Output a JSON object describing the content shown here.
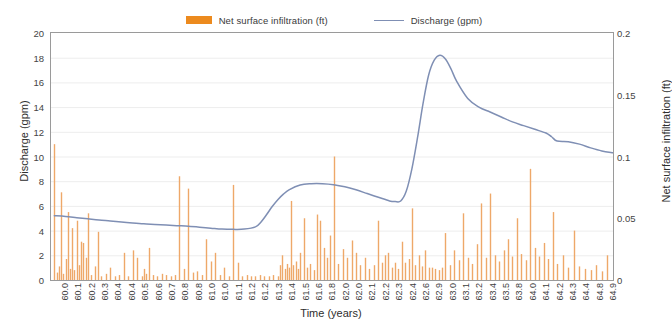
{
  "legend": {
    "position": "top-center",
    "items": [
      {
        "label": "Net surface infiltration (ft)",
        "marker": "bar-swatch-icon",
        "color": "#ec8a1e"
      },
      {
        "label": "Discharge (gpm)",
        "marker": "line-swatch-icon",
        "color": "#7f8fb4"
      }
    ]
  },
  "axes": {
    "x_title": "Time (years)",
    "y_left_title": "Discharge (gpm)",
    "y_right_title": "Net surface infiltration (ft)",
    "y_left_ticks": [
      "0",
      "2",
      "4",
      "6",
      "8",
      "10",
      "12",
      "14",
      "16",
      "18",
      "20"
    ],
    "y_right_ticks": [
      "0",
      "0.05",
      "0.1",
      "0.15",
      "0.2"
    ],
    "x_ticks": [
      "60.0",
      "60.1",
      "60.2",
      "60.3",
      "60.4",
      "60.4",
      "60.5",
      "60.6",
      "60.7",
      "60.8",
      "60.8",
      "61.0",
      "61.0",
      "61.1",
      "61.2",
      "61.2",
      "61.3",
      "61.4",
      "61.5",
      "61.6",
      "61.8",
      "62.0",
      "62.0",
      "62.1",
      "62.2",
      "62.3",
      "62.4",
      "62.6",
      "62.9",
      "63.0",
      "63.1",
      "63.2",
      "63.4",
      "63.5",
      "63.8",
      "64.0",
      "64.1",
      "64.2",
      "64.3",
      "64.4",
      "64.8",
      "64.9"
    ]
  },
  "chart_data": {
    "type": "bar",
    "title": "",
    "xlabel": "Time (years)",
    "ylabel": "Discharge (gpm)",
    "y2label": "Net surface infiltration (ft)",
    "xlim": [
      59.97,
      65.0
    ],
    "ylim": [
      0,
      20
    ],
    "y2lim": [
      0,
      0.2
    ],
    "grid": true,
    "legend_position": "top-center",
    "series": [
      {
        "name": "Net surface infiltration (ft)",
        "type": "bar",
        "axis": "right",
        "color": "#eea869",
        "x": [
          60.0,
          60.02,
          60.04,
          60.06,
          60.08,
          60.1,
          60.12,
          60.14,
          60.16,
          60.18,
          60.2,
          60.22,
          60.24,
          60.26,
          60.28,
          60.3,
          60.33,
          60.36,
          60.39,
          60.42,
          60.46,
          60.5,
          60.54,
          60.58,
          60.62,
          60.66,
          60.7,
          60.74,
          60.78,
          60.8,
          60.82,
          60.85,
          60.88,
          60.92,
          60.96,
          61.0,
          61.04,
          61.08,
          61.12,
          61.16,
          61.2,
          61.24,
          61.28,
          61.32,
          61.36,
          61.4,
          61.44,
          61.48,
          61.52,
          61.56,
          61.6,
          61.64,
          61.68,
          61.72,
          61.76,
          61.8,
          61.84,
          61.88,
          61.92,
          61.96,
          62.0,
          62.02,
          62.04,
          62.06,
          62.08,
          62.1,
          62.12,
          62.14,
          62.16,
          62.18,
          62.2,
          62.23,
          62.26,
          62.29,
          62.32,
          62.35,
          62.38,
          62.41,
          62.44,
          62.47,
          62.5,
          62.54,
          62.58,
          62.62,
          62.66,
          62.7,
          62.74,
          62.78,
          62.82,
          62.86,
          62.9,
          62.93,
          62.96,
          62.99,
          63.02,
          63.05,
          63.08,
          63.11,
          63.14,
          63.17,
          63.2,
          63.23,
          63.26,
          63.29,
          63.32,
          63.35,
          63.38,
          63.41,
          63.44,
          63.47,
          63.5,
          63.54,
          63.58,
          63.62,
          63.66,
          63.7,
          63.74,
          63.78,
          63.82,
          63.86,
          63.9,
          63.94,
          63.98,
          64.02,
          64.06,
          64.1,
          64.14,
          64.18,
          64.22,
          64.26,
          64.3,
          64.34,
          64.38,
          64.42,
          64.46,
          64.5,
          64.55,
          64.6,
          64.65,
          64.7,
          64.75,
          64.8,
          64.85,
          64.9,
          64.95
        ],
        "values_gpm_scale": [
          11.0,
          0.6,
          1.1,
          7.1,
          0.5,
          1.7,
          5.5,
          0.9,
          4.2,
          0.8,
          4.8,
          1.2,
          3.1,
          3.0,
          1.8,
          5.4,
          0.4,
          1.1,
          3.9,
          0.3,
          0.5,
          1.0,
          0.3,
          0.4,
          2.2,
          0.3,
          2.4,
          1.8,
          0.3,
          0.9,
          0.5,
          2.6,
          0.4,
          0.3,
          0.5,
          0.4,
          0.3,
          0.4,
          8.4,
          0.9,
          7.4,
          0.6,
          0.7,
          0.4,
          3.3,
          1.5,
          2.2,
          0.4,
          1.0,
          0.3,
          7.7,
          1.4,
          0.3,
          0.4,
          0.3,
          0.3,
          0.4,
          0.3,
          0.3,
          0.4,
          0.3,
          1.2,
          2.0,
          0.9,
          1.3,
          1.0,
          6.4,
          1.2,
          1.5,
          0.9,
          2.2,
          5.0,
          1.0,
          1.3,
          0.8,
          5.3,
          4.8,
          2.6,
          1.8,
          3.6,
          10.0,
          1.3,
          2.5,
          1.8,
          3.2,
          2.2,
          1.2,
          1.8,
          0.9,
          1.2,
          4.8,
          1.4,
          2.0,
          2.2,
          1.0,
          1.4,
          0.9,
          3.1,
          1.4,
          1.7,
          5.8,
          1.2,
          2.0,
          1.1,
          2.4,
          1.0,
          1.0,
          0.9,
          0.8,
          1.0,
          3.8,
          1.2,
          2.4,
          1.6,
          5.4,
          1.8,
          1.3,
          2.9,
          6.2,
          1.8,
          7.0,
          2.0,
          1.5,
          2.4,
          3.3,
          1.9,
          5.0,
          2.1,
          1.6,
          9.0,
          2.6,
          1.9,
          3.0,
          1.7,
          5.5,
          1.3,
          2.0,
          1.0,
          4.0,
          1.1,
          0.9,
          0.8,
          1.2,
          0.7,
          2.0
        ]
      },
      {
        "name": "Discharge (gpm)",
        "type": "line",
        "axis": "left",
        "color": "#7f8fb4",
        "x": [
          60.0,
          60.1,
          60.2,
          60.3,
          60.4,
          60.5,
          60.6,
          60.7,
          60.8,
          60.9,
          61.0,
          61.1,
          61.2,
          61.3,
          61.4,
          61.5,
          61.6,
          61.7,
          61.8,
          61.85,
          61.9,
          61.95,
          62.0,
          62.05,
          62.1,
          62.2,
          62.3,
          62.4,
          62.5,
          62.6,
          62.7,
          62.8,
          62.9,
          63.0,
          63.05,
          63.1,
          63.15,
          63.2,
          63.25,
          63.3,
          63.35,
          63.4,
          63.45,
          63.5,
          63.55,
          63.6,
          63.7,
          63.8,
          63.9,
          64.0,
          64.1,
          64.2,
          64.3,
          64.4,
          64.45,
          64.5,
          64.6,
          64.7,
          64.8,
          64.9,
          65.0
        ],
        "values": [
          5.2,
          5.15,
          5.05,
          4.95,
          4.85,
          4.78,
          4.7,
          4.62,
          4.55,
          4.5,
          4.45,
          4.4,
          4.35,
          4.28,
          4.2,
          4.12,
          4.1,
          4.12,
          4.3,
          4.7,
          5.3,
          5.95,
          6.5,
          6.95,
          7.3,
          7.7,
          7.8,
          7.8,
          7.72,
          7.55,
          7.3,
          7.0,
          6.7,
          6.4,
          6.35,
          6.4,
          7.2,
          9.0,
          11.5,
          14.3,
          16.6,
          17.8,
          18.2,
          17.9,
          17.1,
          16.1,
          14.7,
          14.0,
          13.6,
          13.2,
          12.8,
          12.5,
          12.2,
          11.9,
          11.6,
          11.25,
          11.2,
          11.0,
          10.7,
          10.45,
          10.3
        ]
      }
    ]
  }
}
